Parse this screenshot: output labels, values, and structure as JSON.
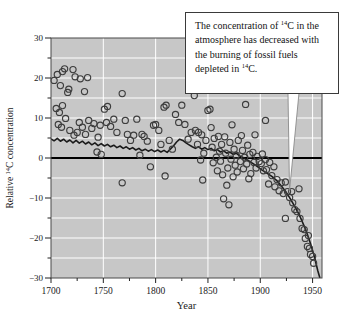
{
  "figure": {
    "name": "carbon-14-concentration-figure",
    "annotation": {
      "line1": "The concentration of ",
      "sup1": "14",
      "line2": "C in the atmosphere has decreased with the burning of fossil fuels depleted in ",
      "sup2": "14",
      "line3": "C."
    }
  },
  "chart_data": {
    "type": "scatter",
    "title": "",
    "xlabel": "Year",
    "ylabel": {
      "pre": "Relative ",
      "sup": "14",
      "post": "C concentration"
    },
    "xlim": [
      1700,
      1959
    ],
    "ylim": [
      -30,
      30
    ],
    "grid": {
      "on": true,
      "horizontal_every": 5,
      "vertical_every": 50
    },
    "x_ticks": [
      {
        "v": 1700,
        "label": "1700"
      },
      {
        "v": 1750,
        "label": "1750"
      },
      {
        "v": 1800,
        "label": "1800"
      },
      {
        "v": 1850,
        "label": "1850"
      },
      {
        "v": 1900,
        "label": "1900"
      },
      {
        "v": 1950,
        "label": "1950"
      }
    ],
    "x_minor_ticks": [
      1725,
      1775,
      1825,
      1875,
      1925
    ],
    "y_ticks": [
      {
        "v": 30,
        "label": "30"
      },
      {
        "v": 20,
        "label": "20"
      },
      {
        "v": 10,
        "label": "10"
      },
      {
        "v": 0,
        "label": "0"
      },
      {
        "v": -10,
        "label": "−10"
      },
      {
        "v": -20,
        "label": "−20"
      },
      {
        "v": -30,
        "label": "−30"
      }
    ],
    "y_minor_ticks": [
      25,
      15,
      5,
      -5,
      -15,
      -25
    ],
    "zero_line": true,
    "legend": "none",
    "colors": {
      "page_bg": "#ffffff",
      "plot_bg": "#c7c7c7",
      "grid": "#ffffff",
      "frame": "#4a4a4a",
      "zero_line": "#000000",
      "trend": "#1b1b1b",
      "point_stroke": "#3d3d3d",
      "text": "#1a1a1a",
      "callout_bg": "#ffffff",
      "callout_border": "#3a3a3a",
      "callout_tail_stroke": "#8a8a8a"
    },
    "series": [
      {
        "name": "annual 14C measurements",
        "kind": "scatter",
        "points": [
          [
            1703,
            19.4
          ],
          [
            1706,
            20.9
          ],
          [
            1709,
            18.1
          ],
          [
            1711,
            21.6
          ],
          [
            1713,
            22.3
          ],
          [
            1716,
            16.4
          ],
          [
            1717,
            17.2
          ],
          [
            1721,
            22.1
          ],
          [
            1723,
            20.3
          ],
          [
            1728,
            19.8
          ],
          [
            1732,
            16.6
          ],
          [
            1735,
            20.1
          ],
          [
            1705,
            12.4
          ],
          [
            1708,
            11.4
          ],
          [
            1711,
            13.1
          ],
          [
            1707,
            8.4
          ],
          [
            1710,
            7.7
          ],
          [
            1714,
            9.9
          ],
          [
            1718,
            6.9
          ],
          [
            1722,
            5.7
          ],
          [
            1725,
            6.4
          ],
          [
            1727,
            8.9
          ],
          [
            1730,
            7.7
          ],
          [
            1733,
            5.9
          ],
          [
            1736,
            9.4
          ],
          [
            1739,
            7.4
          ],
          [
            1741,
            8.6
          ],
          [
            1744,
            1.5
          ],
          [
            1745,
            5.2
          ],
          [
            1747,
            8.2
          ],
          [
            1748,
            0.9
          ],
          [
            1751,
            12.2
          ],
          [
            1754,
            12.9
          ],
          [
            1753,
            8.9
          ],
          [
            1757,
            7.9
          ],
          [
            1760,
            9.7
          ],
          [
            1763,
            6.4
          ],
          [
            1768,
            16.1
          ],
          [
            1768,
            -6.2
          ],
          [
            1771,
            9.4
          ],
          [
            1773,
            5.9
          ],
          [
            1776,
            4.4
          ],
          [
            1779,
            5.7
          ],
          [
            1782,
            9.7
          ],
          [
            1785,
            0.7
          ],
          [
            1787,
            5.9
          ],
          [
            1789,
            5.4
          ],
          [
            1792,
            4.2
          ],
          [
            1795,
            -2.2
          ],
          [
            1798,
            8.2
          ],
          [
            1800,
            8.4
          ],
          [
            1803,
            6.9
          ],
          [
            1805,
            3.4
          ],
          [
            1808,
            12.7
          ],
          [
            1810,
            13.2
          ],
          [
            1809,
            -4.5
          ],
          [
            1813,
            4.4
          ],
          [
            1816,
            2.2
          ],
          [
            1819,
            10.9
          ],
          [
            1822,
            8.9
          ],
          [
            1825,
            13.2
          ],
          [
            1828,
            8.4
          ],
          [
            1831,
            4.7
          ],
          [
            1834,
            6.4
          ],
          [
            1837,
            15.6
          ],
          [
            1838,
            6.9
          ],
          [
            1840,
            3.4
          ],
          [
            1841,
            6.4
          ],
          [
            1843,
            -0.5
          ],
          [
            1844,
            5.8
          ],
          [
            1845,
            -5.5
          ],
          [
            1846,
            1.2
          ],
          [
            1848,
            4.4
          ],
          [
            1850,
            11.9
          ],
          [
            1852,
            12.2
          ],
          [
            1853,
            7.6
          ],
          [
            1854,
            2.7
          ],
          [
            1855,
            -1.2
          ],
          [
            1856,
            4.9
          ],
          [
            1858,
            0.2
          ],
          [
            1859,
            -3.2
          ],
          [
            1860,
            5.4
          ],
          [
            1861,
            1.7
          ],
          [
            1862,
            -0.8
          ],
          [
            1863,
            3.4
          ],
          [
            1864,
            -4.2
          ],
          [
            1865,
            -10.2
          ],
          [
            1866,
            5.3
          ],
          [
            1867,
            1.2
          ],
          [
            1868,
            -6.8
          ],
          [
            1869,
            -2.5
          ],
          [
            1870,
            -11.7
          ],
          [
            1871,
            3.9
          ],
          [
            1872,
            -0.3
          ],
          [
            1873,
            8.3
          ],
          [
            1874,
            -4.7
          ],
          [
            1875,
            2.2
          ],
          [
            1876,
            -1.8
          ],
          [
            1877,
            0.7
          ],
          [
            1878,
            -3.5
          ],
          [
            1879,
            4.4
          ],
          [
            1881,
            -0.9
          ],
          [
            1882,
            5.6
          ],
          [
            1883,
            1.9
          ],
          [
            1884,
            -2.7
          ],
          [
            1885,
            0.2
          ],
          [
            1886,
            13.4
          ],
          [
            1887,
            -1.5
          ],
          [
            1888,
            3.2
          ],
          [
            1889,
            -5.2
          ],
          [
            1890,
            0.9
          ],
          [
            1891,
            -3.9
          ],
          [
            1893,
            1.4
          ],
          [
            1894,
            -1.1
          ],
          [
            1895,
            5.8
          ],
          [
            1896,
            -2.5
          ],
          [
            1897,
            0.4
          ],
          [
            1899,
            -0.9
          ],
          [
            1901,
            -1.4
          ],
          [
            1902,
            1.0
          ],
          [
            1903,
            -3.2
          ],
          [
            1905,
            9.4
          ],
          [
            1905,
            -0.4
          ],
          [
            1906,
            -2.9
          ],
          [
            1908,
            -6.5
          ],
          [
            1909,
            -1.1
          ],
          [
            1911,
            -4.4
          ],
          [
            1913,
            -2.2
          ],
          [
            1914,
            -7.2
          ],
          [
            1916,
            -5.4
          ],
          [
            1918,
            -8.2
          ],
          [
            1920,
            -6.2
          ],
          [
            1922,
            -8.9
          ],
          [
            1924,
            -6.0
          ],
          [
            1924,
            -15.1
          ],
          [
            1926,
            -8.4
          ],
          [
            1928,
            -9.9
          ],
          [
            1930,
            -8.4
          ],
          [
            1931,
            -11.2
          ],
          [
            1933,
            -12.9
          ],
          [
            1935,
            -13.4
          ],
          [
            1937,
            -7.7
          ],
          [
            1938,
            -15.1
          ],
          [
            1940,
            -17.6
          ],
          [
            1942,
            -17.9
          ],
          [
            1943,
            -20.1
          ],
          [
            1945,
            -22.1
          ],
          [
            1946,
            -19.4
          ],
          [
            1947,
            -22.6
          ],
          [
            1948,
            -24.1
          ],
          [
            1950,
            -24.6
          ],
          [
            1951,
            -26.3
          ]
        ]
      },
      {
        "name": "smoothed trend",
        "kind": "line",
        "points": [
          [
            1700,
            4.8
          ],
          [
            1703,
            4.3
          ],
          [
            1706,
            4.9
          ],
          [
            1709,
            4.2
          ],
          [
            1712,
            4.7
          ],
          [
            1715,
            4.0
          ],
          [
            1718,
            4.5
          ],
          [
            1721,
            3.8
          ],
          [
            1724,
            4.4
          ],
          [
            1727,
            3.7
          ],
          [
            1730,
            4.2
          ],
          [
            1733,
            3.5
          ],
          [
            1736,
            4.0
          ],
          [
            1739,
            3.3
          ],
          [
            1742,
            3.8
          ],
          [
            1745,
            3.1
          ],
          [
            1748,
            3.6
          ],
          [
            1751,
            3.0
          ],
          [
            1754,
            3.4
          ],
          [
            1757,
            2.8
          ],
          [
            1760,
            3.2
          ],
          [
            1763,
            2.6
          ],
          [
            1766,
            3.0
          ],
          [
            1769,
            2.4
          ],
          [
            1772,
            2.8
          ],
          [
            1775,
            2.2
          ],
          [
            1778,
            2.6
          ],
          [
            1781,
            2.0
          ],
          [
            1784,
            2.4
          ],
          [
            1787,
            1.8
          ],
          [
            1790,
            2.2
          ],
          [
            1793,
            1.7
          ],
          [
            1796,
            2.1
          ],
          [
            1799,
            1.6
          ],
          [
            1802,
            2.0
          ],
          [
            1805,
            1.5
          ],
          [
            1808,
            1.9
          ],
          [
            1811,
            1.4
          ],
          [
            1814,
            2.2
          ],
          [
            1817,
            3.0
          ],
          [
            1820,
            4.0
          ],
          [
            1823,
            4.7
          ],
          [
            1826,
            4.4
          ],
          [
            1829,
            3.8
          ],
          [
            1832,
            3.3
          ],
          [
            1835,
            2.8
          ],
          [
            1838,
            2.4
          ],
          [
            1841,
            2.8
          ],
          [
            1844,
            2.2
          ],
          [
            1847,
            2.6
          ],
          [
            1850,
            2.1
          ],
          [
            1853,
            2.4
          ],
          [
            1856,
            1.8
          ],
          [
            1859,
            2.1
          ],
          [
            1862,
            1.5
          ],
          [
            1865,
            1.8
          ],
          [
            1868,
            1.2
          ],
          [
            1871,
            1.5
          ],
          [
            1874,
            0.9
          ],
          [
            1877,
            1.2
          ],
          [
            1880,
            0.6
          ],
          [
            1883,
            0.2
          ],
          [
            1886,
            -0.3
          ],
          [
            1889,
            -0.7
          ],
          [
            1892,
            -1.2
          ],
          [
            1895,
            -1.7
          ],
          [
            1898,
            -2.3
          ],
          [
            1901,
            -2.9
          ],
          [
            1904,
            -3.4
          ],
          [
            1907,
            -3.9
          ],
          [
            1910,
            -4.4
          ],
          [
            1913,
            -5.0
          ],
          [
            1916,
            -5.7
          ],
          [
            1919,
            -6.6
          ],
          [
            1922,
            -7.6
          ],
          [
            1925,
            -8.7
          ],
          [
            1928,
            -9.9
          ],
          [
            1931,
            -11.2
          ],
          [
            1934,
            -12.6
          ],
          [
            1937,
            -14.1
          ],
          [
            1940,
            -15.8
          ],
          [
            1943,
            -17.7
          ],
          [
            1946,
            -19.8
          ],
          [
            1949,
            -22.2
          ],
          [
            1952,
            -25.0
          ],
          [
            1955,
            -28.2
          ],
          [
            1957,
            -30.0
          ]
        ]
      }
    ]
  }
}
